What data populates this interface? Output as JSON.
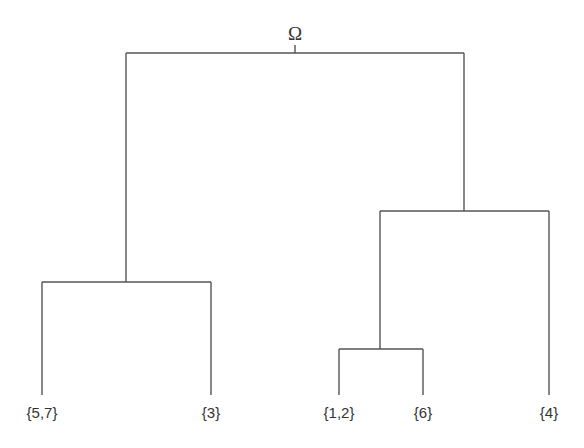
{
  "diagram": {
    "type": "dendrogram",
    "root": {
      "label": "Ω"
    },
    "leaves": [
      {
        "id": "leaf-57",
        "label": "{5,7}"
      },
      {
        "id": "leaf-3",
        "label": "{3}"
      },
      {
        "id": "leaf-12",
        "label": "{1,2}"
      },
      {
        "id": "leaf-6",
        "label": "{6}"
      },
      {
        "id": "leaf-4",
        "label": "{4}"
      }
    ],
    "tree": {
      "label": "Ω",
      "children": [
        {
          "children": [
            {
              "label": "{5,7}"
            },
            {
              "label": "{3}"
            }
          ]
        },
        {
          "children": [
            {
              "children": [
                {
                  "label": "{1,2}"
                },
                {
                  "label": "{6}"
                }
              ]
            },
            {
              "label": "{4}"
            }
          ]
        }
      ]
    },
    "line_color": "#555555"
  }
}
